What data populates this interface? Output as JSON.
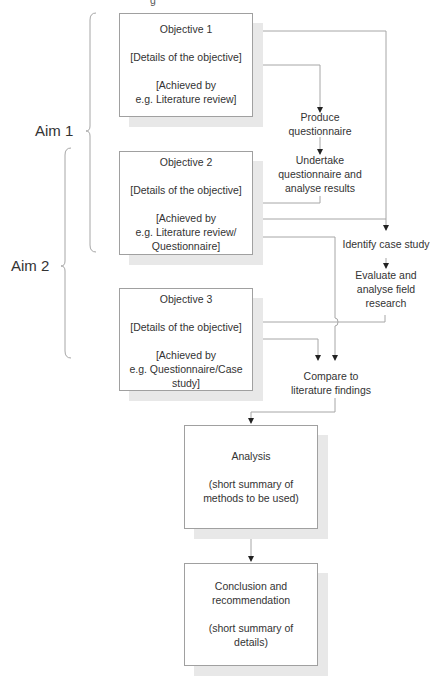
{
  "diagram": {
    "top_cut_text": "g",
    "aims": [
      {
        "label": "Aim 1"
      },
      {
        "label": "Aim 2"
      }
    ],
    "objectives": [
      {
        "title": "Objective 1",
        "details": "[Details of the objective]",
        "achieved_line1": "[Achieved by",
        "achieved_line2": "e.g. Literature review]",
        "achieved_line3": ""
      },
      {
        "title": "Objective 2",
        "details": "[Details of the objective]",
        "achieved_line1": "[Achieved by",
        "achieved_line2": "e.g. Literature review/",
        "achieved_line3": "Questionnaire]"
      },
      {
        "title": "Objective 3",
        "details": "[Details of the objective]",
        "achieved_line1": "[Achieved by",
        "achieved_line2": "e.g. Questionnaire/Case",
        "achieved_line3": "study]"
      }
    ],
    "steps": {
      "produce": {
        "line1": "Produce",
        "line2": "questionnaire"
      },
      "undertake": {
        "line1": "Undertake",
        "line2": "questionnaire and",
        "line3": "analyse results"
      },
      "identify": {
        "line1": "Identify case study"
      },
      "evaluate": {
        "line1": "Evaluate and",
        "line2": "analyse field",
        "line3": "research"
      },
      "compare": {
        "line1": "Compare to",
        "line2": "literature findings"
      }
    },
    "analysis": {
      "title": "Analysis",
      "line1": "(short summary of",
      "line2": "methods to be used)"
    },
    "conclusion": {
      "title1": "Conclusion and",
      "title2": "recommendation",
      "line1": "(short summary of",
      "line2": "details)"
    },
    "colors": {
      "line": "#a6a6a6",
      "border": "#a0a0a0",
      "shadow": "#e8e8e8",
      "text": "#333333"
    }
  }
}
